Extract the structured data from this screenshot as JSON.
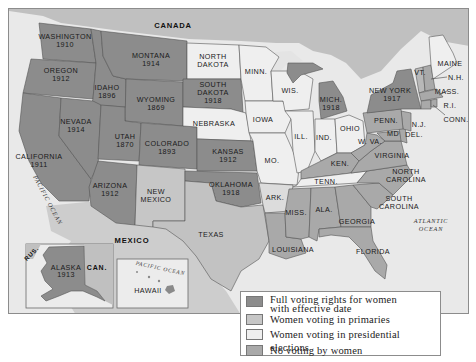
{
  "colors": {
    "full_voting": "#8c8c8c",
    "primaries": "#c6c6c6",
    "presidential": "#efefef",
    "no_voting": "#a9a9a9",
    "foreign_land": "#c0c0c0",
    "mexico": "#cdcdcd",
    "ocean": "#e9e9e9"
  },
  "labels": {
    "canada": "CANADA",
    "mexico": "MEXICO",
    "pacific_ocean": "PACIFIC OCEAN",
    "atlantic_ocean_1": "ATLANTIC",
    "atlantic_ocean_2": "OCEAN"
  },
  "states": {
    "washington": {
      "name": "WASHINGTON",
      "year": "1910"
    },
    "oregon": {
      "name": "OREGON",
      "year": "1912"
    },
    "california": {
      "name": "CALIFORNIA",
      "year": "1911"
    },
    "idaho": {
      "name": "IDAHO",
      "year": "1896"
    },
    "nevada": {
      "name": "NEVADA",
      "year": "1914"
    },
    "montana": {
      "name": "MONTANA",
      "year": "1914"
    },
    "wyoming": {
      "name": "WYOMING",
      "year": "1869"
    },
    "utah": {
      "name": "UTAH",
      "year": "1870"
    },
    "colorado": {
      "name": "COLORADO",
      "year": "1893"
    },
    "arizona": {
      "name": "ARIZONA",
      "year": "1912"
    },
    "new_mexico": {
      "name1": "NEW",
      "name2": "MEXICO"
    },
    "north_dakota": {
      "name1": "NORTH",
      "name2": "DAKOTA"
    },
    "south_dakota": {
      "name1": "SOUTH",
      "name2": "DAKOTA",
      "year": "1918"
    },
    "nebraska": {
      "name": "NEBRASKA"
    },
    "kansas": {
      "name": "KANSAS",
      "year": "1912"
    },
    "oklahoma": {
      "name": "OKLAHOMA",
      "year": "1918"
    },
    "texas": {
      "name": "TEXAS"
    },
    "minnesota": {
      "name": "MINN."
    },
    "iowa": {
      "name": "IOWA"
    },
    "missouri": {
      "name": "MO."
    },
    "arkansas": {
      "name": "ARK."
    },
    "louisiana": {
      "name": "LOUISIANA"
    },
    "wisconsin": {
      "name": "WIS."
    },
    "illinois": {
      "name": "ILL."
    },
    "michigan": {
      "name": "MICH.",
      "year": "1918"
    },
    "indiana": {
      "name": "IND."
    },
    "ohio": {
      "name": "OHIO"
    },
    "kentucky": {
      "name": "KEN."
    },
    "tennessee": {
      "name": "TENN."
    },
    "mississippi": {
      "name": "MISS."
    },
    "alabama": {
      "name": "ALA."
    },
    "georgia": {
      "name": "GEORGIA"
    },
    "florida": {
      "name": "FLORIDA"
    },
    "south_carolina": {
      "name1": "SOUTH",
      "name2": "CAROLINA"
    },
    "north_carolina": {
      "name1": "NORTH",
      "name2": "CAROLINA"
    },
    "virginia": {
      "name": "VIRGINIA"
    },
    "west_virginia": {
      "name": "W. VA."
    },
    "maryland": {
      "name": "MD"
    },
    "delaware": {
      "name": "DEL."
    },
    "new_jersey": {
      "name": "N.J."
    },
    "pennsylvania": {
      "name": "PENN."
    },
    "new_york": {
      "name": "NEW YORK",
      "year": "1917"
    },
    "vermont": {
      "name": "VT."
    },
    "new_hampshire": {
      "name": "N.H."
    },
    "maine": {
      "name": "MAINE"
    },
    "massachusetts": {
      "name": "MASS."
    },
    "rhode_island": {
      "name": "R.I."
    },
    "connecticut": {
      "name": "CONN."
    }
  },
  "insets": {
    "alaska": {
      "name": "ALASKA",
      "year": "1913",
      "rus": "RUS.",
      "can": "CAN."
    },
    "hawaii": {
      "name": "HAWAII",
      "ocean": "PACIFIC OCEAN"
    }
  },
  "legend": {
    "items": [
      {
        "label_line1": "Full voting rights for women",
        "label_line2": "with effective date",
        "swatch": "full_voting"
      },
      {
        "label_line1": "Women voting in primaries",
        "swatch": "primaries"
      },
      {
        "label_line1": "Women voting in presidential elections",
        "swatch": "presidential"
      },
      {
        "label_line1": "No voting by women",
        "swatch": "no_voting"
      }
    ]
  }
}
